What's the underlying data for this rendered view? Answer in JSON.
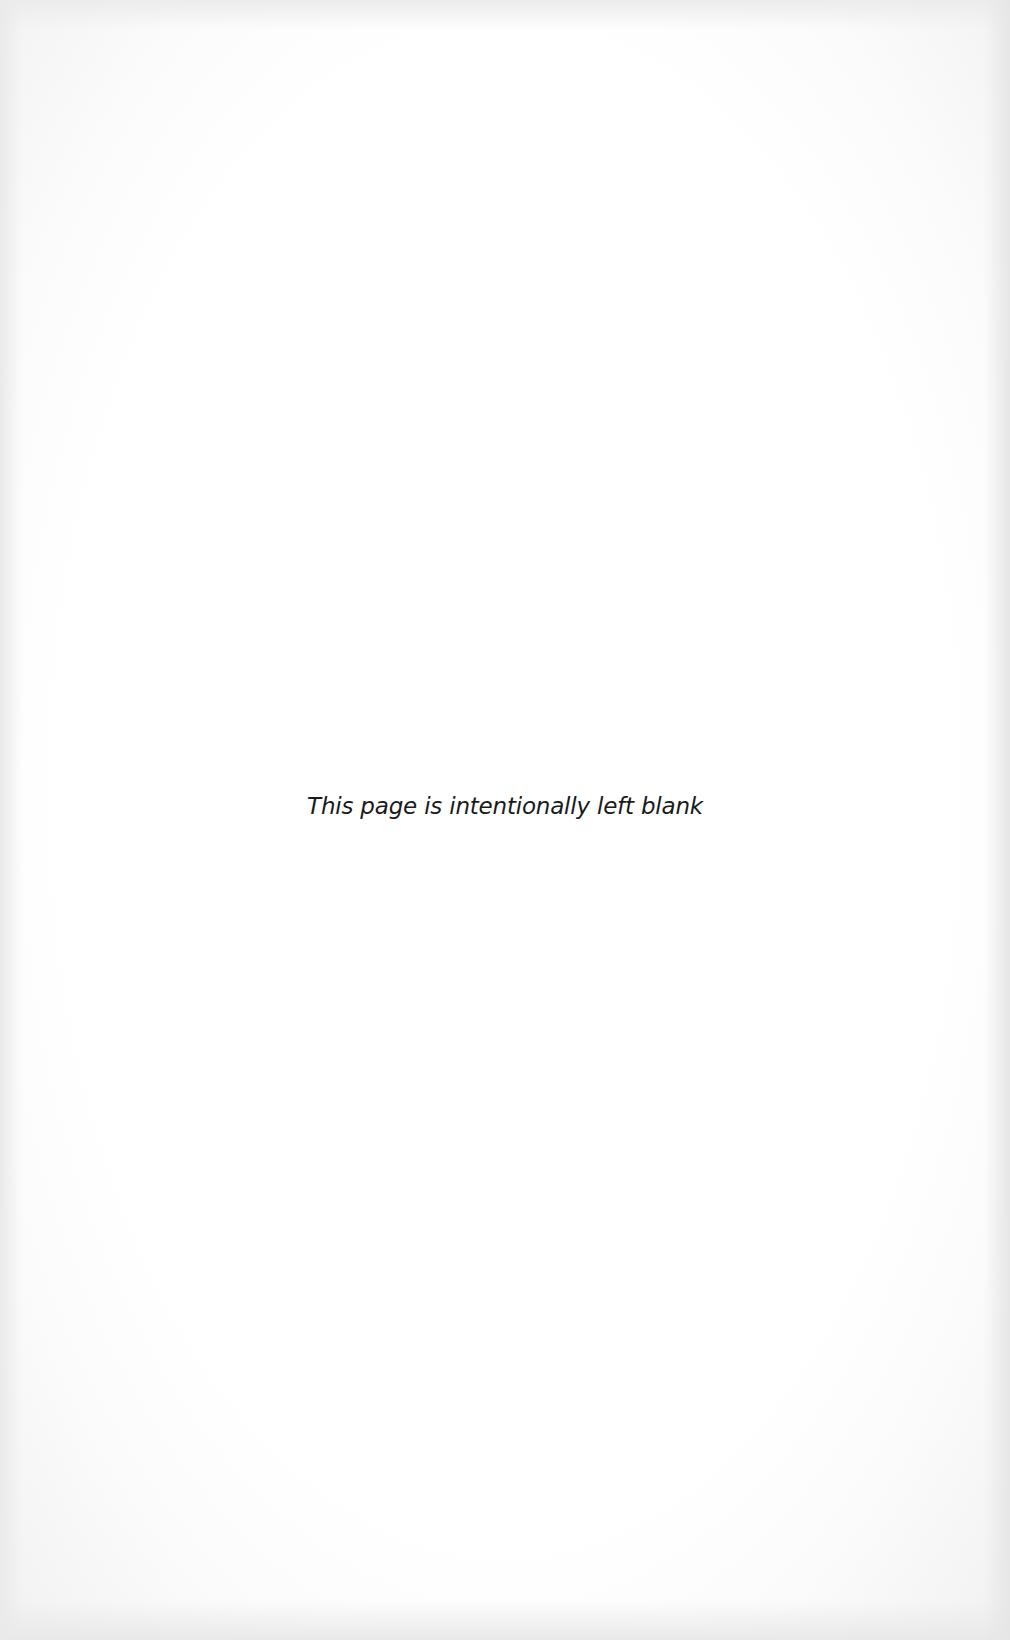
{
  "document": {
    "page_type": "blank page",
    "notice_text": "This page is intentionally left blank",
    "colors": {
      "background": "#ffffff",
      "border_shading": "#eaeaea",
      "text": "#1a1a1a"
    }
  }
}
